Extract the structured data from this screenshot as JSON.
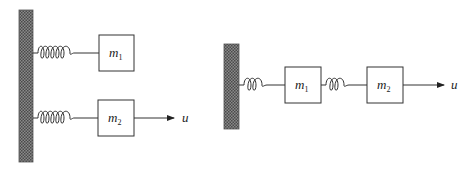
{
  "diagram": {
    "left_system": {
      "description": "Two masses, each attached independently to a fixed wall by a spring; force input on m2",
      "masses": [
        {
          "name": "m",
          "subscript": "1"
        },
        {
          "name": "m",
          "subscript": "2"
        }
      ],
      "input_label": "u"
    },
    "right_system": {
      "description": "Two masses in series: wall - spring - m1 - spring - m2, force input on m2",
      "masses": [
        {
          "name": "m",
          "subscript": "1"
        },
        {
          "name": "m",
          "subscript": "2"
        }
      ],
      "input_label": "u"
    },
    "colors": {
      "wall_fill": "#6e6e6e",
      "stroke": "#333333"
    }
  }
}
